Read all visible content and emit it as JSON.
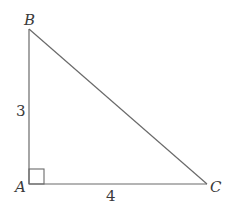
{
  "diagram": {
    "type": "right-triangle",
    "stroke_color": "#6a6a6a",
    "label_color": "#3a3a3a",
    "vertices": {
      "A": {
        "label": "A",
        "x": 29,
        "y": 184
      },
      "B": {
        "label": "B",
        "x": 29,
        "y": 29
      },
      "C": {
        "label": "C",
        "x": 207,
        "y": 184
      }
    },
    "sides": {
      "AB": {
        "label": "3"
      },
      "AC": {
        "label": "4"
      }
    },
    "right_angle_at": "A"
  }
}
